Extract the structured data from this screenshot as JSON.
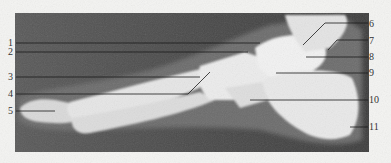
{
  "figure": {
    "colors": {
      "background": "#f4f4f2",
      "film_dark": "#4a4a4a",
      "bone": "#e8e8e8",
      "leader": "#1a1a1a",
      "label": "#333333"
    },
    "labels_left": [
      {
        "num": "1"
      },
      {
        "num": "2"
      },
      {
        "num": "3"
      },
      {
        "num": "4"
      },
      {
        "num": "5"
      }
    ],
    "labels_right": [
      {
        "num": "6"
      },
      {
        "num": "7"
      },
      {
        "num": "8"
      },
      {
        "num": "9"
      },
      {
        "num": "10"
      },
      {
        "num": "11"
      }
    ]
  }
}
